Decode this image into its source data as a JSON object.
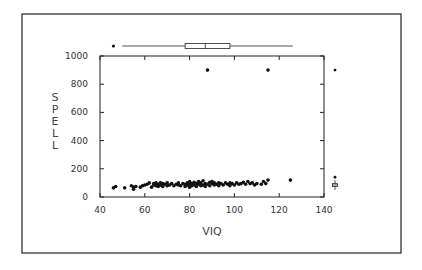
{
  "chart_data": {
    "type": "scatter",
    "title": "",
    "xlabel": "VIQ",
    "ylabel": "SPELL",
    "xlim": [
      40,
      140
    ],
    "ylim": [
      0,
      1000
    ],
    "xticks": [
      40,
      60,
      80,
      100,
      120,
      140
    ],
    "yticks": [
      0,
      200,
      400,
      600,
      800,
      1000
    ],
    "grid": false,
    "legend": null,
    "marginal_boxplots": {
      "top_VIQ": {
        "outlier": 46,
        "whisker_low": 50,
        "q1": 78,
        "median": 87,
        "q3": 98,
        "whisker_high": 126
      },
      "right_SPELL": {
        "outliers": [
          900,
          140
        ],
        "whisker_low": 50,
        "q1": 75,
        "median": 85,
        "q3": 95,
        "whisker_high": 120
      }
    },
    "points": [
      [
        46,
        65
      ],
      [
        47,
        75
      ],
      [
        51,
        65
      ],
      [
        54,
        80
      ],
      [
        55,
        55
      ],
      [
        55,
        70
      ],
      [
        56,
        75
      ],
      [
        58,
        70
      ],
      [
        59,
        80
      ],
      [
        60,
        85
      ],
      [
        61,
        90
      ],
      [
        62,
        100
      ],
      [
        63,
        70
      ],
      [
        64,
        85
      ],
      [
        64,
        95
      ],
      [
        65,
        80
      ],
      [
        65,
        100
      ],
      [
        66,
        75
      ],
      [
        66,
        90
      ],
      [
        67,
        85
      ],
      [
        67,
        100
      ],
      [
        68,
        75
      ],
      [
        68,
        95
      ],
      [
        69,
        90
      ],
      [
        70,
        80
      ],
      [
        70,
        100
      ],
      [
        71,
        85
      ],
      [
        72,
        95
      ],
      [
        73,
        80
      ],
      [
        74,
        90
      ],
      [
        75,
        85
      ],
      [
        75,
        100
      ],
      [
        76,
        80
      ],
      [
        77,
        95
      ],
      [
        78,
        75
      ],
      [
        78,
        90
      ],
      [
        79,
        85
      ],
      [
        79,
        100
      ],
      [
        80,
        70
      ],
      [
        80,
        90
      ],
      [
        80,
        110
      ],
      [
        81,
        80
      ],
      [
        81,
        95
      ],
      [
        82,
        85
      ],
      [
        82,
        105
      ],
      [
        83,
        75
      ],
      [
        83,
        95
      ],
      [
        84,
        90
      ],
      [
        84,
        110
      ],
      [
        85,
        80
      ],
      [
        85,
        100
      ],
      [
        86,
        85
      ],
      [
        86,
        115
      ],
      [
        87,
        75
      ],
      [
        87,
        95
      ],
      [
        88,
        90
      ],
      [
        88,
        900
      ],
      [
        89,
        80
      ],
      [
        89,
        105
      ],
      [
        90,
        95
      ],
      [
        90,
        110
      ],
      [
        91,
        85
      ],
      [
        91,
        100
      ],
      [
        92,
        90
      ],
      [
        93,
        80
      ],
      [
        93,
        100
      ],
      [
        94,
        95
      ],
      [
        95,
        85
      ],
      [
        96,
        100
      ],
      [
        97,
        90
      ],
      [
        98,
        80
      ],
      [
        98,
        100
      ],
      [
        99,
        95
      ],
      [
        100,
        85
      ],
      [
        101,
        100
      ],
      [
        102,
        90
      ],
      [
        103,
        95
      ],
      [
        104,
        105
      ],
      [
        105,
        90
      ],
      [
        106,
        110
      ],
      [
        107,
        95
      ],
      [
        108,
        100
      ],
      [
        109,
        85
      ],
      [
        110,
        95
      ],
      [
        112,
        90
      ],
      [
        113,
        110
      ],
      [
        114,
        95
      ],
      [
        115,
        120
      ],
      [
        115,
        900
      ],
      [
        125,
        120
      ]
    ]
  },
  "axes": {
    "x_title": "VIQ",
    "y_title_letters": [
      "S",
      "P",
      "E",
      "L",
      "L"
    ],
    "x_tick_labels": [
      "40",
      "60",
      "80",
      "100",
      "120",
      "140"
    ],
    "y_tick_labels": [
      "0",
      "200",
      "400",
      "600",
      "800",
      "1000"
    ]
  }
}
